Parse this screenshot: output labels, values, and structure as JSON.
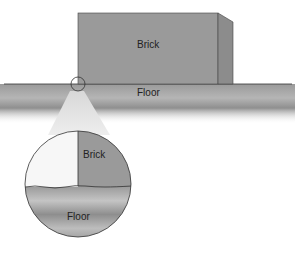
{
  "diagram": {
    "labels": {
      "brick": "Brick",
      "floor": "Floor",
      "zoom_brick": "Brick",
      "zoom_floor": "Floor"
    },
    "colors": {
      "brick": "#9a9a9a",
      "brick_side": "#8c8c8c",
      "floor": "#a8a8a8",
      "outline": "#333333"
    }
  }
}
